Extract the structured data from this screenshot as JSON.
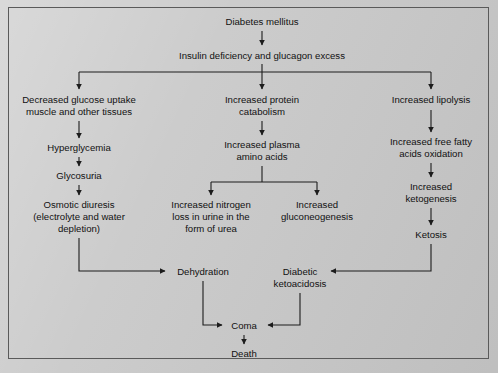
{
  "figure": {
    "background_color": "#c9c9c9",
    "border_color": "#5a5a5a",
    "text_color": "#111111",
    "arrow_color": "#1c1c1c"
  },
  "nodes": {
    "diabetes_mellitus": {
      "label": "Diabetes mellitus",
      "x": 262,
      "y": 22
    },
    "insulin_deficiency": {
      "label": "Insulin deficiency and glucagon excess",
      "x": 262,
      "y": 56
    },
    "decreased_glucose_uptake_l1": {
      "label": "Decreased glucose uptake",
      "x": 79,
      "y": 100
    },
    "decreased_glucose_uptake_l2": {
      "label": "muscle and other tissues",
      "x": 79,
      "y": 112
    },
    "hyperglycemia": {
      "label": "Hyperglycemia",
      "x": 79,
      "y": 148
    },
    "glycosuria": {
      "label": "Glycosuria",
      "x": 79,
      "y": 176
    },
    "osmotic_diuresis_l1": {
      "label": "Osmotic diuresis",
      "x": 79,
      "y": 205
    },
    "osmotic_diuresis_l2": {
      "label": "(electrolyte and water",
      "x": 79,
      "y": 217
    },
    "osmotic_diuresis_l3": {
      "label": "depletion)",
      "x": 79,
      "y": 229
    },
    "increased_protein_catabolism_l1": {
      "label": "Increased protein",
      "x": 262,
      "y": 100
    },
    "increased_protein_catabolism_l2": {
      "label": "catabolism",
      "x": 262,
      "y": 112
    },
    "increased_plasma_amino_acids_l1": {
      "label": "Increased plasma",
      "x": 262,
      "y": 145
    },
    "increased_plasma_amino_acids_l2": {
      "label": "amino acids",
      "x": 262,
      "y": 157
    },
    "increased_nitrogen_loss_l1": {
      "label": "Increased nitrogen",
      "x": 211,
      "y": 205
    },
    "increased_nitrogen_loss_l2": {
      "label": "loss in urine in the",
      "x": 211,
      "y": 217
    },
    "increased_nitrogen_loss_l3": {
      "label": "form of urea",
      "x": 211,
      "y": 229
    },
    "increased_gluconeogenesis_l1": {
      "label": "Increased",
      "x": 317,
      "y": 205
    },
    "increased_gluconeogenesis_l2": {
      "label": "gluconeogenesis",
      "x": 317,
      "y": 217
    },
    "increased_lipolysis": {
      "label": "Increased lipolysis",
      "x": 431,
      "y": 100
    },
    "increased_free_fatty_acids_l1": {
      "label": "Increased free fatty",
      "x": 431,
      "y": 142
    },
    "increased_free_fatty_acids_l2": {
      "label": "acids oxidation",
      "x": 431,
      "y": 154
    },
    "increased_ketogenesis_l1": {
      "label": "Increased",
      "x": 431,
      "y": 187
    },
    "increased_ketogenesis_l2": {
      "label": "ketogenesis",
      "x": 431,
      "y": 199
    },
    "ketosis": {
      "label": "Ketosis",
      "x": 431,
      "y": 235
    },
    "dehydration": {
      "label": "Dehydration",
      "x": 203,
      "y": 272
    },
    "diabetic_ketoacidosis_l1": {
      "label": "Diabetic",
      "x": 300,
      "y": 272
    },
    "diabetic_ketoacidosis_l2": {
      "label": "ketoacidosis",
      "x": 300,
      "y": 284
    },
    "coma": {
      "label": "Coma",
      "x": 244,
      "y": 326
    },
    "death": {
      "label": "Death",
      "x": 244,
      "y": 354
    }
  },
  "edges": [
    {
      "name": "diabetes-to-insulin",
      "from": "diabetes_mellitus",
      "to": "insulin_deficiency"
    },
    {
      "name": "insulin-to-glucose-uptake",
      "from": "insulin_deficiency",
      "to": "decreased_glucose_uptake_l1"
    },
    {
      "name": "insulin-to-protein-catabolism",
      "from": "insulin_deficiency",
      "to": "increased_protein_catabolism_l1"
    },
    {
      "name": "insulin-to-lipolysis",
      "from": "insulin_deficiency",
      "to": "increased_lipolysis"
    },
    {
      "name": "glucose-uptake-to-hyperglycemia",
      "from": "decreased_glucose_uptake_l2",
      "to": "hyperglycemia"
    },
    {
      "name": "hyperglycemia-to-glycosuria",
      "from": "hyperglycemia",
      "to": "glycosuria"
    },
    {
      "name": "glycosuria-to-osmotic-diuresis",
      "from": "glycosuria",
      "to": "osmotic_diuresis_l1"
    },
    {
      "name": "osmotic-diuresis-to-dehydration",
      "from": "osmotic_diuresis_l3",
      "to": "dehydration"
    },
    {
      "name": "protein-catabolism-to-plasma-amino-acids",
      "from": "increased_protein_catabolism_l2",
      "to": "increased_plasma_amino_acids_l1"
    },
    {
      "name": "plasma-amino-acids-to-nitrogen-loss",
      "from": "increased_plasma_amino_acids_l2",
      "to": "increased_nitrogen_loss_l1"
    },
    {
      "name": "plasma-amino-acids-to-gluconeogenesis",
      "from": "increased_plasma_amino_acids_l2",
      "to": "increased_gluconeogenesis_l1"
    },
    {
      "name": "lipolysis-to-free-fatty-acids",
      "from": "increased_lipolysis",
      "to": "increased_free_fatty_acids_l1"
    },
    {
      "name": "free-fatty-acids-to-ketogenesis",
      "from": "increased_free_fatty_acids_l2",
      "to": "increased_ketogenesis_l1"
    },
    {
      "name": "ketogenesis-to-ketosis",
      "from": "increased_ketogenesis_l2",
      "to": "ketosis"
    },
    {
      "name": "ketosis-to-diabetic-ketoacidosis",
      "from": "ketosis",
      "to": "diabetic_ketoacidosis_l1"
    },
    {
      "name": "dehydration-to-coma",
      "from": "dehydration",
      "to": "coma"
    },
    {
      "name": "diabetic-ketoacidosis-to-coma",
      "from": "diabetic_ketoacidosis_l2",
      "to": "coma"
    },
    {
      "name": "coma-to-death",
      "from": "coma",
      "to": "death"
    }
  ]
}
